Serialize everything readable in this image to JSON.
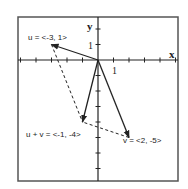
{
  "diagram": {
    "type": "vector-addition",
    "axes": {
      "x_label": "x",
      "y_label": "y",
      "x_range": [
        -6,
        5
      ],
      "y_range": [
        -8,
        3
      ],
      "tick_step": 1,
      "x_unit_label": "1",
      "y_unit_label": "1"
    },
    "vectors": [
      {
        "id": "u",
        "label": "u = <-3, 1>",
        "components": [
          -3,
          1
        ],
        "style": "solid-arrow"
      },
      {
        "id": "v",
        "label": "v = <2, -5>",
        "components": [
          2,
          -5
        ],
        "style": "solid-arrow"
      },
      {
        "id": "sum",
        "label": "u + v = <-1, -4>",
        "components": [
          -1,
          -4
        ],
        "style": "solid-arrow"
      }
    ],
    "parallelogram_edges": [
      {
        "from": [
          -3,
          1
        ],
        "to": [
          -1,
          -4
        ],
        "style": "dashed"
      },
      {
        "from": [
          2,
          -5
        ],
        "to": [
          -1,
          -4
        ],
        "style": "dashed"
      }
    ],
    "colors": {
      "line": "#222222",
      "frame": "#555555",
      "background": "#ffffff"
    }
  }
}
